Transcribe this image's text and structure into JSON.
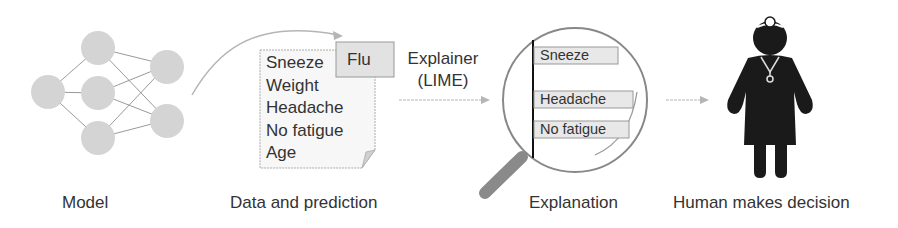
{
  "stages": {
    "model": {
      "label": "Model"
    },
    "data": {
      "label": "Data and prediction",
      "features": [
        "Sneeze",
        "Weight",
        "Headache",
        "No fatigue",
        "Age"
      ],
      "prediction": "Flu"
    },
    "explainer": {
      "line1": "Explainer",
      "line2": "(LIME)"
    },
    "explanation": {
      "label": "Explanation",
      "bars": [
        "Sneeze",
        "Headache",
        "No fatigue"
      ]
    },
    "human": {
      "label": "Human makes decision"
    }
  },
  "colors": {
    "node": "#d4d4d4",
    "edge": "#9a9a9a",
    "arrow": "#b0b0b0",
    "figure": "#1a1a1a",
    "text": "#333333"
  }
}
